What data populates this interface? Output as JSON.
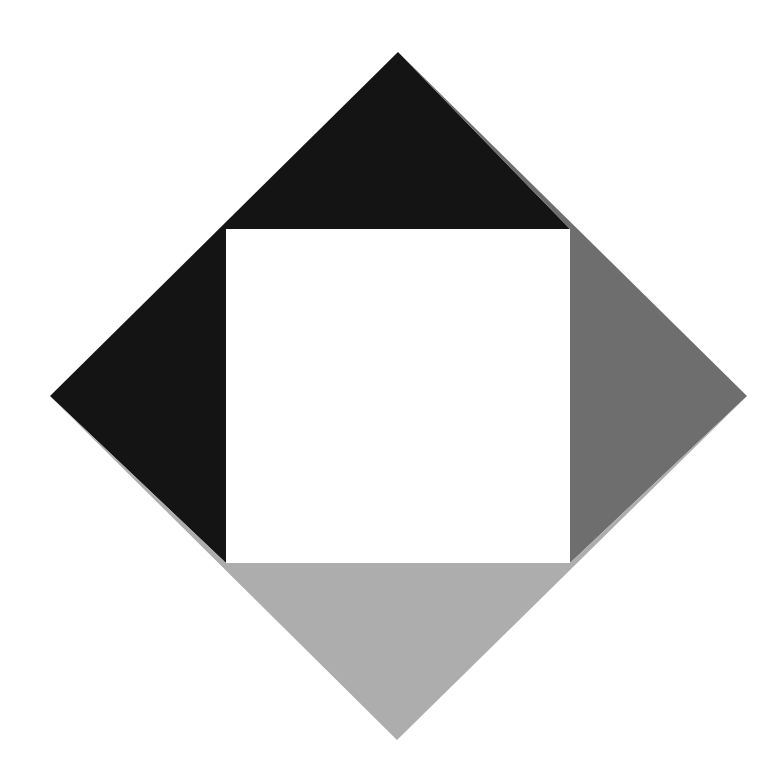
{
  "artwork": {
    "title": "Geometric Composition — Diamond with Inset Square",
    "style": "De Stijl / Neoplasticism abstract geometric composition",
    "canvas": {
      "width": 774,
      "height": 784,
      "background_color": "#ffffff"
    },
    "palette": {
      "background": "#ffffff",
      "dark": "#141414",
      "medium_gray": "#6e6e6e",
      "light_gray": "#adadad",
      "inset_square": "#ffffff"
    },
    "shapes": [
      {
        "name": "diamond-region-dark",
        "label": "Dark region (top and left of diamond)",
        "color": "#141414",
        "points": "398,52 570,229 226,229 226,563 50,396"
      },
      {
        "name": "diamond-region-medium-gray",
        "label": "Medium gray region (right of diamond)",
        "color": "#6e6e6e",
        "points": "398,52 747,396 570,563 570,229"
      },
      {
        "name": "diamond-region-light-gray",
        "label": "Light gray region (bottom of diamond)",
        "color": "#adadad",
        "points": "226,563 570,563 747,396 397,740 50,396"
      },
      {
        "name": "inset-square-white",
        "label": "White inset square",
        "color": "#ffffff",
        "points": "226,229 570,229 570,563 226,563"
      }
    ],
    "geometry": {
      "diamond_vertices": {
        "top": [
          398,
          52
        ],
        "right": [
          747,
          396
        ],
        "bottom": [
          397,
          740
        ],
        "left": [
          50,
          396
        ]
      },
      "inset_square": {
        "top_left": [
          226,
          229
        ],
        "top_right": [
          570,
          229
        ],
        "bottom_right": [
          570,
          563
        ],
        "bottom_left": [
          226,
          563
        ],
        "side_length": 344
      }
    }
  }
}
